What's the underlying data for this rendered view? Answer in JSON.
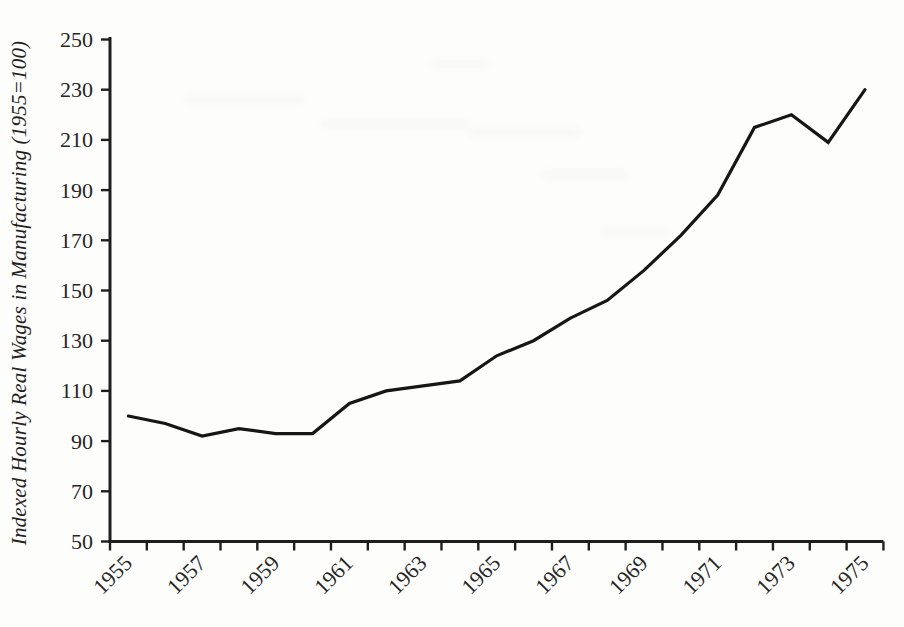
{
  "chart_data": {
    "type": "line",
    "title": "",
    "xlabel": "",
    "ylabel": "Indexed Hourly Real Wages in Manufacturing (1955=100)",
    "series_name": "Indexed hourly real wages in manufacturing",
    "x": [
      1955,
      1956,
      1957,
      1958,
      1959,
      1960,
      1961,
      1962,
      1963,
      1964,
      1965,
      1966,
      1967,
      1968,
      1969,
      1970,
      1971,
      1972,
      1973,
      1974,
      1975
    ],
    "values": [
      100,
      97,
      92,
      95,
      93,
      93,
      105,
      110,
      112,
      114,
      124,
      130,
      139,
      146,
      158,
      172,
      188,
      215,
      220,
      209,
      230
    ],
    "ylim": [
      50,
      250
    ],
    "y_ticks": [
      50,
      70,
      90,
      110,
      130,
      150,
      170,
      190,
      210,
      230,
      250
    ],
    "x_tick_labels": [
      "1955",
      "1957",
      "1959",
      "1961",
      "1963",
      "1965",
      "1967",
      "1969",
      "1971",
      "1973",
      "1975"
    ],
    "grid": false,
    "legend_position": "none",
    "colors": {
      "line": "#161616",
      "axis": "#1e1e1e",
      "tick_text": "#262626"
    }
  }
}
